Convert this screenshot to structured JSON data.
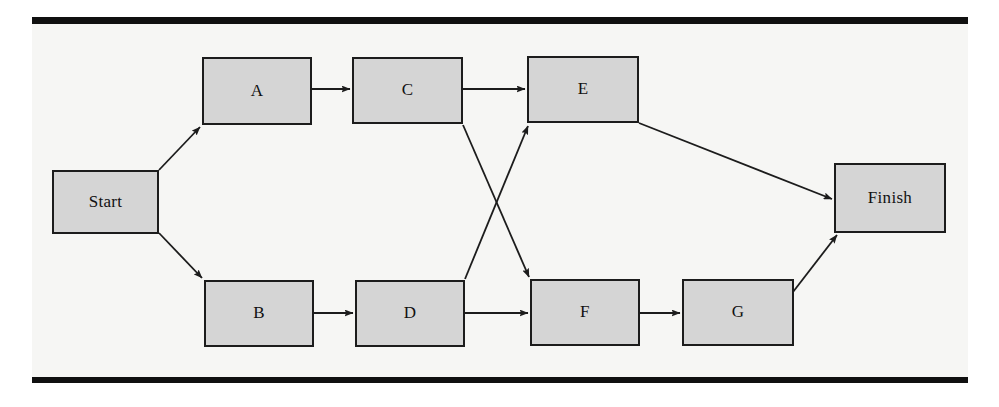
{
  "page": {
    "background_color": "#ffffff",
    "panel_color": "#f6f6f4",
    "rule_color": "#101010"
  },
  "diagram": {
    "type": "flow-network",
    "node_fill_color": "#d5d5d5",
    "node_border_color": "#1c1c1c",
    "edge_color": "#1c1c1c",
    "nodes": [
      {
        "id": "start",
        "label": "Start",
        "x": 52,
        "y": 170,
        "width": 107,
        "height": 64
      },
      {
        "id": "a",
        "label": "A",
        "x": 202,
        "y": 57,
        "width": 110,
        "height": 68
      },
      {
        "id": "c",
        "label": "C",
        "x": 352,
        "y": 57,
        "width": 111,
        "height": 67
      },
      {
        "id": "e",
        "label": "E",
        "x": 527,
        "y": 56,
        "width": 112,
        "height": 67
      },
      {
        "id": "b",
        "label": "B",
        "x": 204,
        "y": 280,
        "width": 110,
        "height": 67
      },
      {
        "id": "d",
        "label": "D",
        "x": 355,
        "y": 280,
        "width": 110,
        "height": 67
      },
      {
        "id": "f",
        "label": "F",
        "x": 530,
        "y": 279,
        "width": 110,
        "height": 67
      },
      {
        "id": "g",
        "label": "G",
        "x": 682,
        "y": 279,
        "width": 112,
        "height": 67
      },
      {
        "id": "finish",
        "label": "Finish",
        "x": 834,
        "y": 163,
        "width": 112,
        "height": 70
      }
    ],
    "edges": [
      {
        "from": "start",
        "to": "a",
        "x1": 159,
        "y1": 170,
        "x2": 200,
        "y2": 127
      },
      {
        "from": "start",
        "to": "b",
        "x1": 159,
        "y1": 233,
        "x2": 202,
        "y2": 278
      },
      {
        "from": "a",
        "to": "c",
        "x1": 312,
        "y1": 89,
        "x2": 350,
        "y2": 89
      },
      {
        "from": "c",
        "to": "e",
        "x1": 463,
        "y1": 89,
        "x2": 525,
        "y2": 89
      },
      {
        "from": "c",
        "to": "f",
        "x1": 463,
        "y1": 125,
        "x2": 529,
        "y2": 277
      },
      {
        "from": "d",
        "to": "e",
        "x1": 465,
        "y1": 279,
        "x2": 528,
        "y2": 126
      },
      {
        "from": "b",
        "to": "d",
        "x1": 314,
        "y1": 313,
        "x2": 353,
        "y2": 313
      },
      {
        "from": "d",
        "to": "f",
        "x1": 465,
        "y1": 313,
        "x2": 528,
        "y2": 313
      },
      {
        "from": "f",
        "to": "g",
        "x1": 640,
        "y1": 313,
        "x2": 680,
        "y2": 313
      },
      {
        "from": "e",
        "to": "finish",
        "x1": 639,
        "y1": 123,
        "x2": 832,
        "y2": 199
      },
      {
        "from": "g",
        "to": "finish",
        "x1": 793,
        "y1": 292,
        "x2": 837,
        "y2": 235
      }
    ]
  }
}
